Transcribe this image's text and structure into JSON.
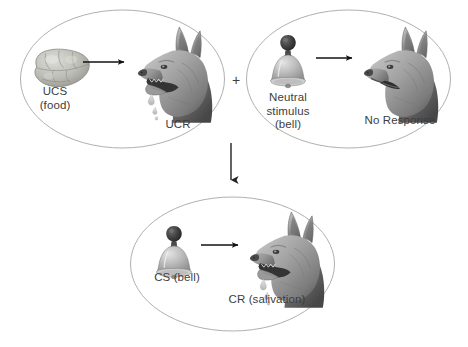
{
  "diagram": {
    "type": "classical-conditioning",
    "background_color": "#ffffff",
    "text_color": "#3d3d3d",
    "oval_stroke_color": "#b0b0b0",
    "arrow_color": "#1a1a1a",
    "panels": [
      {
        "id": "panel-ucs",
        "position": "top-left",
        "stimulus_icon": "food-icon",
        "response_icon": "dog-head-salivating-icon",
        "stimulus_label_line1": "UCS",
        "stimulus_label_line2": "(food)",
        "response_label": "UCR",
        "arrow": "right-arrow-icon"
      },
      {
        "id": "panel-neutral",
        "position": "top-right",
        "stimulus_icon": "bell-icon",
        "response_icon": "dog-head-icon",
        "stimulus_label_line1": "Neutral",
        "stimulus_label_line2": "stimulus",
        "stimulus_label_line3": "(bell)",
        "response_label": "No Response",
        "arrow": "right-arrow-icon"
      },
      {
        "id": "panel-conditioned",
        "position": "bottom-center",
        "stimulus_icon": "bell-icon",
        "response_icon": "dog-head-salivating-icon",
        "stimulus_label": "CS (bell)",
        "response_label": "CR (salivation)",
        "arrow": "right-arrow-icon"
      }
    ],
    "connectors": {
      "plus": "+",
      "down_arrow": "down-arrow-icon"
    }
  }
}
